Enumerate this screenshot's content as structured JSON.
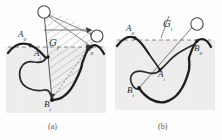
{
  "figure": {
    "background_color": "#ffffff",
    "shade_color": "#eceaea",
    "ink_color": "#2b2b2b",
    "hatch_color": "#8f8f8f"
  },
  "panels": [
    {
      "id": "a",
      "caption": "(a)",
      "labels": {
        "a0": "A",
        "a0_sub": "0",
        "ai": "A",
        "ai_sub": "i",
        "b0": "B",
        "b0_sub": "0",
        "bi": "B",
        "bi_sub": "i",
        "region": "G",
        "region_sub": "i"
      },
      "markers": [
        {
          "name": "node-top",
          "x": 44,
          "y": 12
        },
        {
          "name": "node-right",
          "x": 96,
          "y": 36
        },
        {
          "name": "point-a0",
          "x": 28,
          "y": 45
        },
        {
          "name": "point-ai",
          "x": 48,
          "y": 55
        },
        {
          "name": "point-b0",
          "x": 92,
          "y": 48
        },
        {
          "name": "point-bi",
          "x": 52,
          "y": 100
        }
      ]
    },
    {
      "id": "b",
      "caption": "(b)",
      "labels": {
        "a0": "A",
        "a0_sub": "0",
        "ai": "A",
        "ai_sub": "i",
        "b0": "B",
        "b0_sub": "0",
        "bi": "B",
        "bi_sub": "i",
        "region": "G",
        "region_sub": "i"
      },
      "markers": [
        {
          "name": "node-right",
          "x": 84,
          "y": 23
        },
        {
          "name": "point-a0",
          "x": 22,
          "y": 37
        },
        {
          "name": "point-ai",
          "x": 49,
          "y": 70
        },
        {
          "name": "point-b0",
          "x": 88,
          "y": 42
        },
        {
          "name": "point-bi",
          "x": 28,
          "y": 88
        }
      ]
    }
  ]
}
